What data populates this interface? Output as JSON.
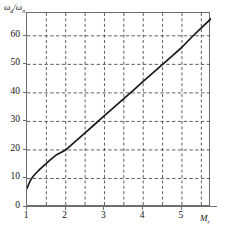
{
  "chart_data": {
    "type": "line",
    "title": "",
    "xlabel": "M_r",
    "ylabel": "omega_d / omega_n",
    "xlim": [
      1,
      5.75
    ],
    "ylim": [
      0,
      68
    ],
    "grid": true,
    "grid_style": "dashed",
    "legend": "none",
    "xticks": [
      1,
      2,
      3,
      4,
      5
    ],
    "xtick_labels": [
      "1",
      "2",
      "3",
      "4",
      "5"
    ],
    "x_minor_gridlines": [
      1.5,
      2.5,
      3.5,
      4.5,
      5.5
    ],
    "yticks": [
      0,
      10,
      20,
      30,
      40,
      50,
      60
    ],
    "ytick_labels": [
      "0",
      "10",
      "20",
      "30",
      "40",
      "50",
      "60"
    ],
    "series": [
      {
        "name": "omega_d/omega_n vs M_r",
        "color": "#1a1a1a",
        "x": [
          1.0,
          1.05,
          1.1,
          1.15,
          1.2,
          1.3,
          1.4,
          1.5,
          1.6,
          1.75,
          2.0,
          2.25,
          2.5,
          2.75,
          3.0,
          3.25,
          3.5,
          3.75,
          4.0,
          4.25,
          4.5,
          4.75,
          5.0,
          5.25,
          5.5,
          5.75
        ],
        "y": [
          6.5,
          8.2,
          9.6,
          10.6,
          11.4,
          12.8,
          14.1,
          15.3,
          16.5,
          18.2,
          20.0,
          23.0,
          26.0,
          29.0,
          32.0,
          35.0,
          38.0,
          41.0,
          44.0,
          47.0,
          50.0,
          53.0,
          56.0,
          59.5,
          62.8,
          66.0
        ]
      }
    ]
  },
  "labels": {
    "y_axis_symbol": "ω",
    "y_axis_sub1": "d",
    "y_axis_slash": "/ω",
    "y_axis_sub2": "n",
    "x_axis_symbol": "M",
    "x_axis_sub": "r"
  },
  "colors": {
    "curve": "#1a1a1a",
    "frame": "#6e6e6e",
    "grid": "#4d4d4d",
    "axis": "#6e6e6e",
    "background": "#ffffff"
  }
}
